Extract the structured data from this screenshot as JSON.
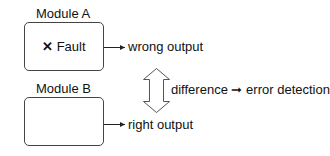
{
  "diagram": {
    "module_a": {
      "title": "Module A",
      "content_icon": "x-mark-icon",
      "content_label": "Fault",
      "output_label": "wrong output"
    },
    "module_b": {
      "title": "Module B",
      "output_label": "right output"
    },
    "comparison": {
      "label": "difference",
      "connector": "➞",
      "result": "error detection"
    }
  }
}
